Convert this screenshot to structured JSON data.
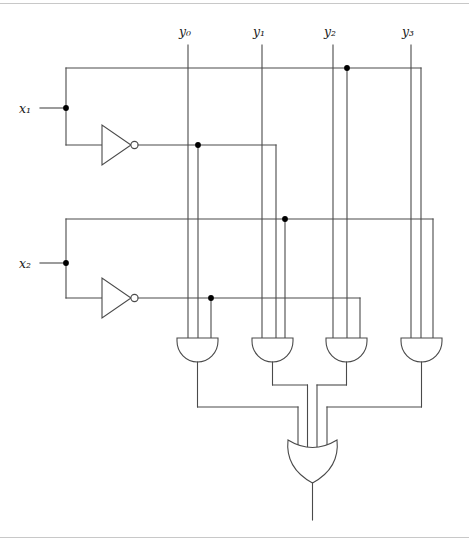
{
  "diagram": {
    "background_color": "#ffffff",
    "wire_color": "#4a4a4a",
    "junction_color": "#000000",
    "frame_color": "#c8c8c8"
  },
  "inputs": [
    {
      "name": "x1",
      "base": "x",
      "subscript": "1",
      "label": "x₁"
    },
    {
      "name": "x2",
      "base": "x",
      "subscript": "2",
      "label": "x₂"
    }
  ],
  "outputs": [
    {
      "name": "y0",
      "base": "y",
      "subscript": "0",
      "label": "y₀"
    },
    {
      "name": "y1",
      "base": "y",
      "subscript": "1",
      "label": "y₁"
    },
    {
      "name": "y2",
      "base": "y",
      "subscript": "2",
      "label": "y₂"
    },
    {
      "name": "y3",
      "base": "y",
      "subscript": "3",
      "label": "y₃"
    }
  ],
  "gates": {
    "inverters": [
      {
        "name": "inverter-x1",
        "input": "x1",
        "output": "not-x1"
      },
      {
        "name": "inverter-x2",
        "input": "x2",
        "output": "not-x2"
      }
    ],
    "and_gates": [
      {
        "name": "and-gate-1",
        "inputs": [
          "y0",
          "not-x1",
          "not-x2"
        ]
      },
      {
        "name": "and-gate-2",
        "inputs": [
          "y1",
          "not-x1",
          "x2"
        ]
      },
      {
        "name": "and-gate-3",
        "inputs": [
          "y2",
          "x1",
          "not-x2"
        ]
      },
      {
        "name": "and-gate-4",
        "inputs": [
          "y3",
          "x1",
          "x2"
        ]
      }
    ],
    "or_gate": {
      "name": "or-gate",
      "inputs": [
        "and-gate-1",
        "and-gate-2",
        "and-gate-3",
        "and-gate-4"
      ]
    }
  }
}
